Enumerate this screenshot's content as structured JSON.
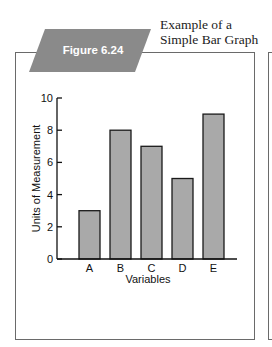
{
  "figure": {
    "label": "Figure 6.24",
    "caption_line1": "Example of a",
    "caption_line2": "Simple Bar Graph"
  },
  "colors": {
    "banner": "#8a8a8a",
    "bar_fill": "#a9a9a9",
    "bar_stroke": "#1a1a1a",
    "frame": "#6a6a6a"
  },
  "chart_data": {
    "type": "bar",
    "title": "Example of a Simple Bar Graph",
    "categories": [
      "A",
      "B",
      "C",
      "D",
      "E"
    ],
    "values": [
      3,
      8,
      7,
      5,
      9
    ],
    "xlabel": "Variables",
    "ylabel": "Units of Measurement",
    "ylim": [
      0,
      10
    ],
    "yticks": [
      0,
      2,
      4,
      6,
      8,
      10
    ],
    "grid": false,
    "legend": null
  }
}
